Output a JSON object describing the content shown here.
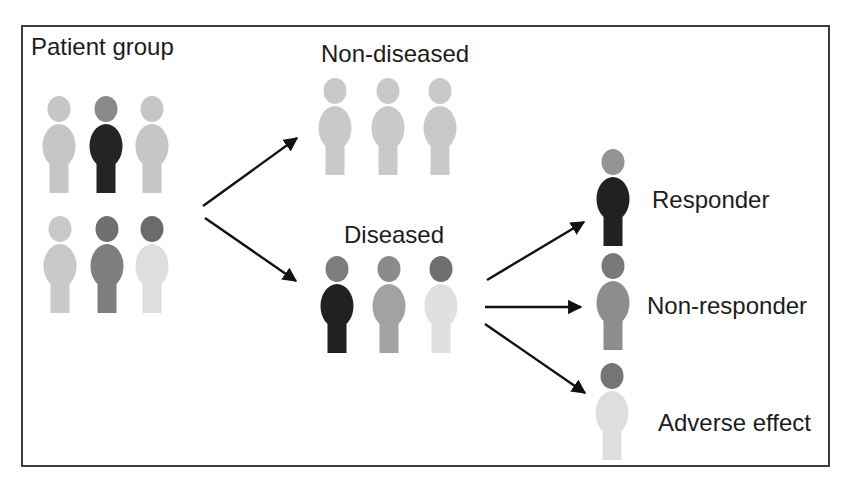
{
  "groups": {
    "patient": {
      "label": "Patient group",
      "figures": [
        {
          "head": "#c6c6c6",
          "body": "#c6c6c6"
        },
        {
          "head": "#8a8a8a",
          "body": "#242424"
        },
        {
          "head": "#c6c6c6",
          "body": "#c6c6c6"
        },
        {
          "head": "#c9c9c9",
          "body": "#c9c9c9"
        },
        {
          "head": "#6f6f6f",
          "body": "#7e7e7e"
        },
        {
          "head": "#6b6b6b",
          "body": "#dedede"
        }
      ]
    },
    "non_diseased": {
      "label": "Non-diseased",
      "figures": [
        {
          "head": "#c9c9c9",
          "body": "#c9c9c9"
        },
        {
          "head": "#c9c9c9",
          "body": "#c9c9c9"
        },
        {
          "head": "#c9c9c9",
          "body": "#c9c9c9"
        }
      ]
    },
    "diseased": {
      "label": "Diseased",
      "figures": [
        {
          "head": "#7d7d7d",
          "body": "#212121"
        },
        {
          "head": "#8b8b8b",
          "body": "#a2a2a2"
        },
        {
          "head": "#6e6e6e",
          "body": "#e0e0e0"
        }
      ]
    },
    "outcomes": [
      {
        "label": "Responder",
        "figure": {
          "head": "#949494",
          "body": "#212121"
        }
      },
      {
        "label": "Non-responder",
        "figure": {
          "head": "#787878",
          "body": "#8d8d8d"
        }
      },
      {
        "label": "Adverse effect",
        "figure": {
          "head": "#757575",
          "body": "#dedede"
        }
      }
    ]
  },
  "connections": [
    {
      "from": "Patient group",
      "to": "Non-diseased"
    },
    {
      "from": "Patient group",
      "to": "Diseased"
    },
    {
      "from": "Diseased",
      "to": "Responder"
    },
    {
      "from": "Diseased",
      "to": "Non-responder"
    },
    {
      "from": "Diseased",
      "to": "Adverse effect"
    }
  ],
  "colors": {
    "arrow": "#111111",
    "border": "#3d3d3d",
    "text": "#1c1c1c"
  }
}
